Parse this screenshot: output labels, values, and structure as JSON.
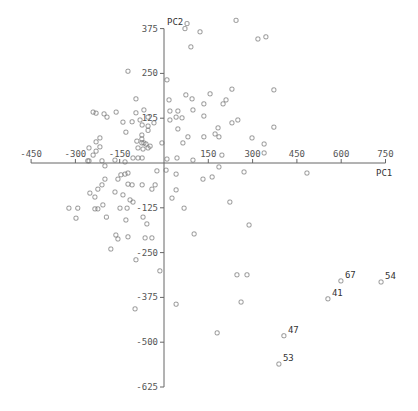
{
  "chart_data": {
    "type": "scatter",
    "title": "",
    "xlabel": "PC1",
    "ylabel": "PC2",
    "xlim": [
      -450,
      750
    ],
    "ylim": [
      -625,
      375
    ],
    "xticks": [
      -450,
      -300,
      -150,
      150,
      300,
      450,
      600,
      750
    ],
    "yticks": [
      375,
      250,
      125,
      -125,
      -250,
      -375,
      -500,
      -625
    ],
    "grid": false,
    "marker": "open-square",
    "points": [
      [
        78,
        389
      ],
      [
        71,
        375
      ],
      [
        122,
        366
      ],
      [
        244,
        398
      ],
      [
        91,
        324
      ],
      [
        318,
        346
      ],
      [
        345,
        352
      ],
      [
        10,
        232
      ],
      [
        230,
        206
      ],
      [
        372,
        204
      ],
      [
        74,
        190
      ],
      [
        156,
        193
      ],
      [
        17,
        176
      ],
      [
        95,
        179
      ],
      [
        210,
        176
      ],
      [
        200,
        165
      ],
      [
        135,
        165
      ],
      [
        20,
        145
      ],
      [
        47,
        145
      ],
      [
        98,
        148
      ],
      [
        41,
        128
      ],
      [
        61,
        126
      ],
      [
        20,
        120
      ],
      [
        135,
        131
      ],
      [
        230,
        112
      ],
      [
        250,
        120
      ],
      [
        47,
        95
      ],
      [
        183,
        98
      ],
      [
        372,
        100
      ],
      [
        173,
        81
      ],
      [
        186,
        73
      ],
      [
        135,
        73
      ],
      [
        81,
        73
      ],
      [
        64,
        56
      ],
      [
        298,
        70
      ],
      [
        339,
        53
      ],
      [
        339,
        28
      ],
      [
        196,
        22
      ],
      [
        10,
        11
      ],
      [
        44,
        14
      ],
      [
        98,
        8
      ],
      [
        -122,
        256
      ],
      [
        -230,
        139
      ],
      [
        -95,
        179
      ],
      [
        -95,
        140
      ],
      [
        -81,
        120
      ],
      [
        -240,
        142
      ],
      [
        -193,
        128
      ],
      [
        -162,
        142
      ],
      [
        -68,
        148
      ],
      [
        -54,
        128
      ],
      [
        -34,
        112
      ],
      [
        -108,
        115
      ],
      [
        -74,
        106
      ],
      [
        -54,
        103
      ],
      [
        -54,
        91
      ],
      [
        -139,
        114
      ],
      [
        -129,
        86
      ],
      [
        -75,
        78
      ],
      [
        -75,
        67
      ],
      [
        -61,
        53
      ],
      [
        -7,
        56
      ],
      [
        -92,
        61
      ],
      [
        -75,
        56
      ],
      [
        -68,
        56
      ],
      [
        -88,
        42
      ],
      [
        -71,
        39
      ],
      [
        -54,
        42
      ],
      [
        -47,
        47
      ],
      [
        -203,
        137
      ],
      [
        -217,
        45
      ],
      [
        -230,
        59
      ],
      [
        -217,
        70
      ],
      [
        -254,
        42
      ],
      [
        -230,
        33
      ],
      [
        -240,
        22
      ],
      [
        -258,
        6
      ],
      [
        -105,
        14
      ],
      [
        -88,
        14
      ],
      [
        -74,
        14
      ],
      [
        -210,
        6
      ],
      [
        -166,
        8
      ],
      [
        -132,
        3
      ],
      [
        -200,
        -8
      ],
      [
        -254,
        6
      ],
      [
        -24,
        -22
      ],
      [
        -146,
        -33
      ],
      [
        -132,
        -31
      ],
      [
        -122,
        -28
      ],
      [
        -156,
        -45
      ],
      [
        -200,
        -45
      ],
      [
        -210,
        -61
      ],
      [
        -224,
        -73
      ],
      [
        -251,
        -84
      ],
      [
        -166,
        -81
      ],
      [
        -122,
        -59
      ],
      [
        -108,
        -61
      ],
      [
        -74,
        -61
      ],
      [
        -30,
        -61
      ],
      [
        -41,
        -73
      ],
      [
        -234,
        -95
      ],
      [
        -139,
        -89
      ],
      [
        -115,
        -103
      ],
      [
        -105,
        -109
      ],
      [
        -322,
        -126
      ],
      [
        -292,
        -126
      ],
      [
        -234,
        -128
      ],
      [
        -224,
        -128
      ],
      [
        -207,
        -117
      ],
      [
        -149,
        -126
      ],
      [
        -125,
        -126
      ],
      [
        -71,
        -151
      ],
      [
        -298,
        -154
      ],
      [
        -195,
        -151
      ],
      [
        -129,
        -159
      ],
      [
        -58,
        -170
      ],
      [
        -163,
        -201
      ],
      [
        -156,
        -212
      ],
      [
        -122,
        -206
      ],
      [
        -64,
        -209
      ],
      [
        -41,
        -209
      ],
      [
        -180,
        -240
      ],
      [
        -95,
        -270
      ],
      [
        -14,
        -301
      ],
      [
        -98,
        -407
      ],
      [
        7,
        -20
      ],
      [
        41,
        -31
      ],
      [
        186,
        -11
      ],
      [
        132,
        -45
      ],
      [
        163,
        -39
      ],
      [
        271,
        -25
      ],
      [
        484,
        -28
      ],
      [
        41,
        -75
      ],
      [
        27,
        -98
      ],
      [
        68,
        -126
      ],
      [
        223,
        -109
      ],
      [
        288,
        -173
      ],
      [
        102,
        -198
      ],
      [
        247,
        -312
      ],
      [
        281,
        -312
      ],
      [
        41,
        -394
      ],
      [
        261,
        -388
      ],
      [
        180,
        -474
      ],
      [
        406,
        -482
      ],
      [
        389,
        -561
      ],
      [
        599,
        -329
      ],
      [
        735,
        -332
      ],
      [
        555,
        -379
      ]
    ],
    "labeled_points": [
      {
        "label": "47",
        "x": 406,
        "y": -482
      },
      {
        "label": "53",
        "x": 389,
        "y": -561
      },
      {
        "label": "67",
        "x": 599,
        "y": -329
      },
      {
        "label": "54",
        "x": 735,
        "y": -332
      },
      {
        "label": "41",
        "x": 555,
        "y": -379
      }
    ]
  }
}
